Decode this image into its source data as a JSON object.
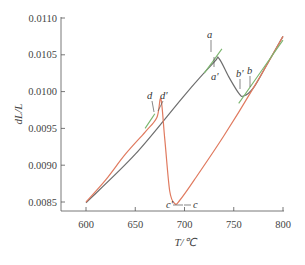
{
  "chart_data": {
    "type": "line",
    "title": "",
    "xlabel": "T/℃",
    "ylabel": "dL/L",
    "xlim": [
      580,
      805
    ],
    "ylim": [
      0.00825,
      0.011
    ],
    "x_ticks": [
      600,
      650,
      700,
      750,
      800
    ],
    "x_tick_labels": [
      "600",
      "650",
      "700",
      "750",
      "800"
    ],
    "y_ticks": [
      0.0085,
      0.009,
      0.0095,
      0.01,
      0.0105,
      0.011
    ],
    "y_tick_labels": [
      "0.0085",
      "0.0090",
      "0.0095",
      "0.0100",
      "0.0105",
      "0.0110"
    ],
    "grid": false,
    "legend": null,
    "series": [
      {
        "name": "heating curve",
        "color": "#6e6e6e",
        "x": [
          600,
          650,
          700,
          730,
          735,
          745,
          755,
          760,
          770,
          785,
          800
        ],
        "y": [
          0.00849,
          0.00915,
          0.00995,
          0.0104,
          0.01045,
          0.0102,
          0.00998,
          0.00994,
          0.01005,
          0.0104,
          0.01075
        ]
      },
      {
        "name": "cooling curve",
        "color": "#e07a5f",
        "x": [
          800,
          770,
          740,
          710,
          695,
          690,
          685,
          680,
          676,
          672,
          660,
          640,
          620,
          600
        ],
        "y": [
          0.01075,
          0.01005,
          0.0094,
          0.0088,
          0.00852,
          0.00848,
          0.00865,
          0.00935,
          0.0099,
          0.00965,
          0.00945,
          0.00915,
          0.0088,
          0.0085
        ]
      },
      {
        "name": "tangent (low T)",
        "color": "#7cb66f",
        "x": [
          660,
          670
        ],
        "y": [
          0.0095,
          0.0097
        ]
      },
      {
        "name": "tangent (high T)",
        "color": "#7cb66f",
        "x": [
          755,
          800
        ],
        "y": [
          0.00984,
          0.0107
        ]
      },
      {
        "name": "tangent (a)",
        "color": "#7cb66f",
        "x": [
          720,
          738
        ],
        "y": [
          0.01025,
          0.01058
        ]
      }
    ],
    "annotations": [
      {
        "label": "a",
        "x": 733,
        "y": 0.01062
      },
      {
        "label": "a'",
        "x": 735,
        "y": 0.01018
      },
      {
        "label": "b'",
        "x": 756,
        "y": 0.01012
      },
      {
        "label": "b",
        "x": 766,
        "y": 0.01018
      },
      {
        "label": "d",
        "x": 664,
        "y": 0.00985
      },
      {
        "label": "d'",
        "x": 676,
        "y": 0.00985
      },
      {
        "label": "c'",
        "x": 684,
        "y": 0.00843
      },
      {
        "label": "c",
        "x": 701,
        "y": 0.00843
      }
    ]
  },
  "labels": {
    "xlabel": "T/℃",
    "ylabel": "dL/L",
    "annot_a": "a",
    "annot_a_prime": "a'",
    "annot_b": "b",
    "annot_b_prime": "b'",
    "annot_d": "d",
    "annot_d_prime": "d'",
    "annot_c": "c",
    "annot_c_prime": "c'"
  }
}
